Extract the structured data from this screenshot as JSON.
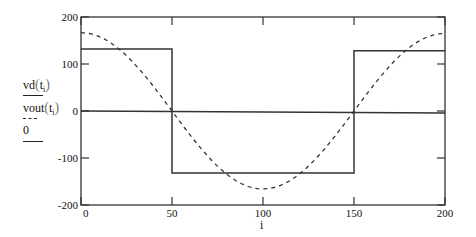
{
  "chart_data": {
    "type": "line",
    "title": "",
    "xlabel": "i",
    "ylabel": "",
    "xlim": [
      0,
      200
    ],
    "ylim": [
      -200,
      200
    ],
    "grid": false,
    "legend_position": "left",
    "x_ticks": [
      "0",
      "50",
      "100",
      "150",
      "200"
    ],
    "y_ticks": [
      "200",
      "100",
      "0",
      "-100",
      "-200"
    ],
    "series": [
      {
        "name": "vd(t_i)",
        "style": "solid",
        "description": "square wave",
        "x": [
          0,
          50,
          50,
          150,
          150,
          200
        ],
        "values": [
          132,
          132,
          -132,
          -132,
          128,
          128
        ]
      },
      {
        "name": "vout(t_i)",
        "style": "dashed",
        "description": "cosine-like wave",
        "x": [
          0,
          25,
          50,
          75,
          100,
          125,
          150,
          175,
          200
        ],
        "values": [
          165,
          118,
          0,
          -118,
          -168,
          -118,
          0,
          118,
          162
        ]
      },
      {
        "name": "0",
        "style": "solid",
        "description": "zero reference line",
        "x": [
          0,
          200
        ],
        "values": [
          0,
          -4
        ]
      }
    ]
  },
  "legend": {
    "entries": [
      {
        "func": "vd",
        "arg": "t",
        "sub": "i",
        "style": "solid"
      },
      {
        "func": "vout",
        "arg": "t",
        "sub": "i",
        "style": "dashed"
      },
      {
        "func": "0",
        "arg": "",
        "sub": "",
        "style": "solid"
      }
    ]
  },
  "axes": {
    "xlabel": "i",
    "y_ticks": [
      "200",
      "100",
      "0",
      "-100",
      "-200"
    ],
    "x_ticks": [
      "0",
      "50",
      "100",
      "150",
      "200"
    ]
  }
}
